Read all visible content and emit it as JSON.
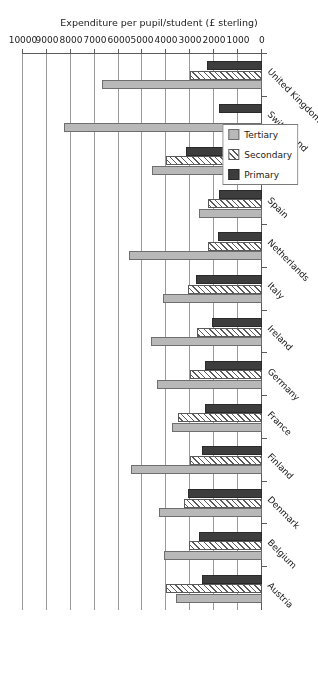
{
  "chart_data": {
    "type": "bar",
    "orientation": "horizontal",
    "title": "",
    "xlabel": "",
    "ylabel": "Expenditure per pupil/student (£ sterling)",
    "ylim": [
      0,
      10000
    ],
    "grid": true,
    "legend_position": "top-left",
    "tick_labels": [
      "0",
      "1000",
      "2000",
      "3000",
      "4000",
      "5000",
      "6000",
      "7000",
      "8000",
      "9000",
      "10000"
    ],
    "tick_values": [
      0,
      1000,
      2000,
      3000,
      4000,
      5000,
      6000,
      7000,
      8000,
      9000,
      10000
    ],
    "categories": [
      "Austria",
      "Belgium",
      "Denmark",
      "Finland",
      "France",
      "Germany",
      "Ireland",
      "Italy",
      "Netherlands",
      "Spain",
      "Sweden",
      "Switzerland",
      "United Kingdom"
    ],
    "series": [
      {
        "name": "Primary",
        "color": "#3d3d3d",
        "values": [
          2500,
          2650,
          3100,
          2500,
          2400,
          2400,
          2100,
          2750,
          1850,
          1800,
          3200,
          1800,
          2300
        ]
      },
      {
        "name": "Secondary",
        "color": "#ffffff",
        "values": [
          4000,
          3050,
          3250,
          3000,
          3500,
          3000,
          2700,
          3100,
          2250,
          2250,
          4000,
          0,
          3000
        ]
      },
      {
        "name": "Tertiary",
        "color": "#b8b8b8",
        "values": [
          3600,
          4100,
          4300,
          5500,
          3750,
          4400,
          4650,
          4150,
          5550,
          2650,
          4600,
          8300,
          6700
        ]
      }
    ]
  },
  "legend": {
    "items": [
      {
        "label": "Primary",
        "swatch": "primary"
      },
      {
        "label": "Secondary",
        "swatch": "secondary"
      },
      {
        "label": "Tertiary",
        "swatch": "tertiary"
      }
    ]
  },
  "axis": {
    "value_axis_title": "Expenditure per pupil/student (£ sterling)"
  }
}
